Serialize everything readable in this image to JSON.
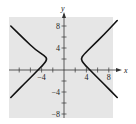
{
  "panel_label": "",
  "chart_data": {
    "type": "line",
    "title": "",
    "xlabel": "x",
    "ylabel": "y",
    "xlim": [
      -10,
      10
    ],
    "ylim": [
      -9,
      10
    ],
    "grid": false,
    "background": "#e6e6e6",
    "x_ticks": [
      -8,
      -6,
      -4,
      -2,
      2,
      4,
      6,
      8
    ],
    "y_ticks": [
      -8,
      -6,
      -4,
      -2,
      2,
      4,
      6,
      8
    ],
    "x_tick_labels": [
      {
        "value": -4,
        "text": "−4"
      },
      {
        "value": 4,
        "text": "4"
      },
      {
        "value": 8,
        "text": "8"
      }
    ],
    "y_tick_labels": [
      {
        "value": 8,
        "text": "8"
      },
      {
        "value": 4,
        "text": "4"
      },
      {
        "value": -4,
        "text": "−4"
      },
      {
        "value": -8,
        "text": "−8"
      }
    ],
    "series": [
      {
        "name": "hyperbola-right-branch",
        "description": "Horizontal hyperbola, right branch, vertex near (3, 2)",
        "points": [
          [
            9.5,
            9
          ],
          [
            7,
            6.3
          ],
          [
            5,
            4.3
          ],
          [
            3.5,
            2.8
          ],
          [
            3,
            2
          ],
          [
            3.5,
            1.2
          ],
          [
            5,
            -0.4
          ],
          [
            7,
            -2.4
          ],
          [
            9.5,
            -5
          ]
        ]
      },
      {
        "name": "hyperbola-left-branch",
        "description": "Horizontal hyperbola, left branch, vertex near (-3, 2)",
        "points": [
          [
            -9.5,
            8
          ],
          [
            -7,
            5.5
          ],
          [
            -5,
            3.6
          ],
          [
            -3.5,
            2.6
          ],
          [
            -3,
            2
          ],
          [
            -3.5,
            1.2
          ],
          [
            -5,
            -0.4
          ],
          [
            -7,
            -2.4
          ],
          [
            -9.5,
            -5
          ]
        ]
      }
    ]
  }
}
